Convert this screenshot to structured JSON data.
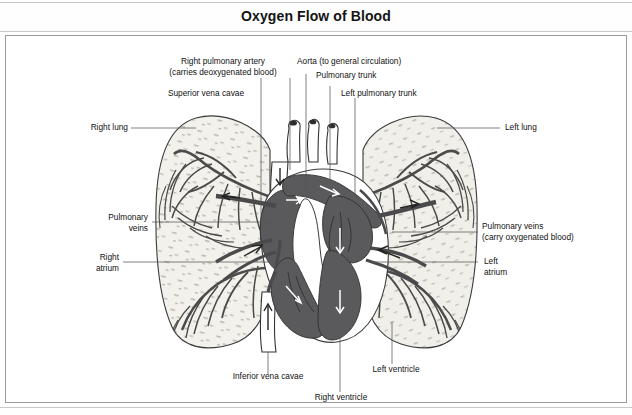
{
  "title": "Oxygen Flow of Blood",
  "figure": {
    "type": "anatomical-diagram",
    "shading": {
      "lung_fill": "#f2f0ea",
      "heart_chamber_fill": "#5a5a5c",
      "vessel_dark": "#4a4a4c",
      "vessel_white": "#ffffff",
      "outline": "#333333",
      "leader_line": "#555555"
    }
  },
  "labels": {
    "right_pulmonary_artery": {
      "line1": "Right pulmonary artery",
      "line2": "(carries deoxygenated blood)"
    },
    "aorta": "Aorta (to general circulation)",
    "pulmonary_trunk": "Pulmonary trunk",
    "left_pulmonary_trunk": "Left pulmonary trunk",
    "superior_vena_cavae": "Superior vena cavae",
    "right_lung": "Right lung",
    "left_lung": "Left lung",
    "pulmonary_veins_left": {
      "line1": "Pulmonary",
      "line2": "veins"
    },
    "pulmonary_veins_right": {
      "line1": "Pulmonary veins",
      "line2": "(carry oxygenated blood)"
    },
    "right_atrium": {
      "line1": "Right",
      "line2": "atrium"
    },
    "left_atrium": {
      "line1": "Left",
      "line2": "atrium"
    },
    "inferior_vena_cavae": "Inferior vena cavae",
    "right_ventricle": "Right ventricle",
    "left_ventricle": "Left ventricle"
  }
}
